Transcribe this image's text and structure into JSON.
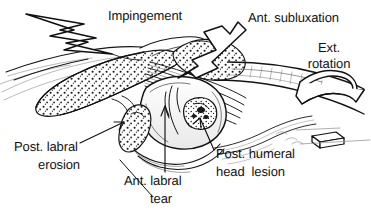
{
  "figure": {
    "kind": "anatomical line illustration",
    "background_color": "#ffffff",
    "ink_color": "#121212",
    "width": 371,
    "height": 214
  },
  "labels": {
    "impingement": "Impingement",
    "ant_subluxation": "Ant. subluxation",
    "ext_rotation_line1": "Ext.",
    "ext_rotation_line2": "rotation",
    "post_labral_erosion_line1": "Post. labral",
    "post_labral_erosion_line2": "erosion",
    "ant_labral_tear_line1": "Ant. labral",
    "ant_labral_tear_line2": "tear",
    "post_humeral_head_lesion_line1": "Post. humeral",
    "post_humeral_head_lesion_line2": "head  lesion"
  },
  "markers": {
    "lightning_bolt": "lightning-bolt",
    "subluxation_arrow": "block-arrow-up-right",
    "rotation_arrow": "curved-band-arrow-left",
    "rotation_block": "small-block-slab",
    "erosion_leader": "thin-arrow-up-right",
    "tear_leader": "thin-arrow-up",
    "lesion_leader": "thin-arrow-up-left"
  },
  "anatomy": {
    "acromion": "stippled-acromion",
    "humeral_head": "humeral-head",
    "humeral_head_lesion": "stippled-lesion",
    "posterior_labrum": "stippled-labrum",
    "humeral_shaft": "humeral-shaft",
    "capsule_fibers": "capsular-fiber-bundle",
    "greater_tuberosity": "stippled-tuberosity"
  }
}
